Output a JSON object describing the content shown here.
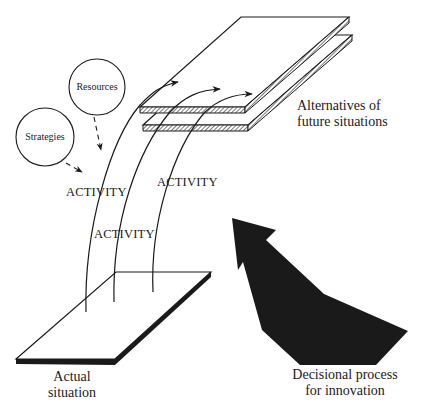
{
  "diagram": {
    "type": "conceptual-diagram",
    "colors": {
      "ink": "#1a1a1a",
      "background": "#ffffff",
      "hatch": "#777777"
    },
    "nodes": {
      "resources": {
        "label": "Resources",
        "shape": "circle"
      },
      "strategies": {
        "label": "Strategies",
        "shape": "circle"
      },
      "future": {
        "label_line1": "Alternatives of",
        "label_line2": "future situations",
        "shape": "stacked-plates"
      },
      "actual": {
        "label_line1": "Actual",
        "label_line2": "situation",
        "shape": "plate"
      },
      "decisional": {
        "label_line1": "Decisional process",
        "label_line2": "for innovation",
        "shape": "large-black-arrow"
      }
    },
    "activities": [
      {
        "label": "ACTIVITY"
      },
      {
        "label": "ACTIVITY"
      },
      {
        "label": "ACTIVITY"
      }
    ],
    "edges": [
      {
        "from": "resources",
        "to": "activity",
        "style": "dashed-arrow"
      },
      {
        "from": "strategies",
        "to": "activity",
        "style": "dashed-arrow"
      },
      {
        "from": "actual",
        "to": "future",
        "style": "curved-arrow",
        "count": 3
      }
    ]
  }
}
